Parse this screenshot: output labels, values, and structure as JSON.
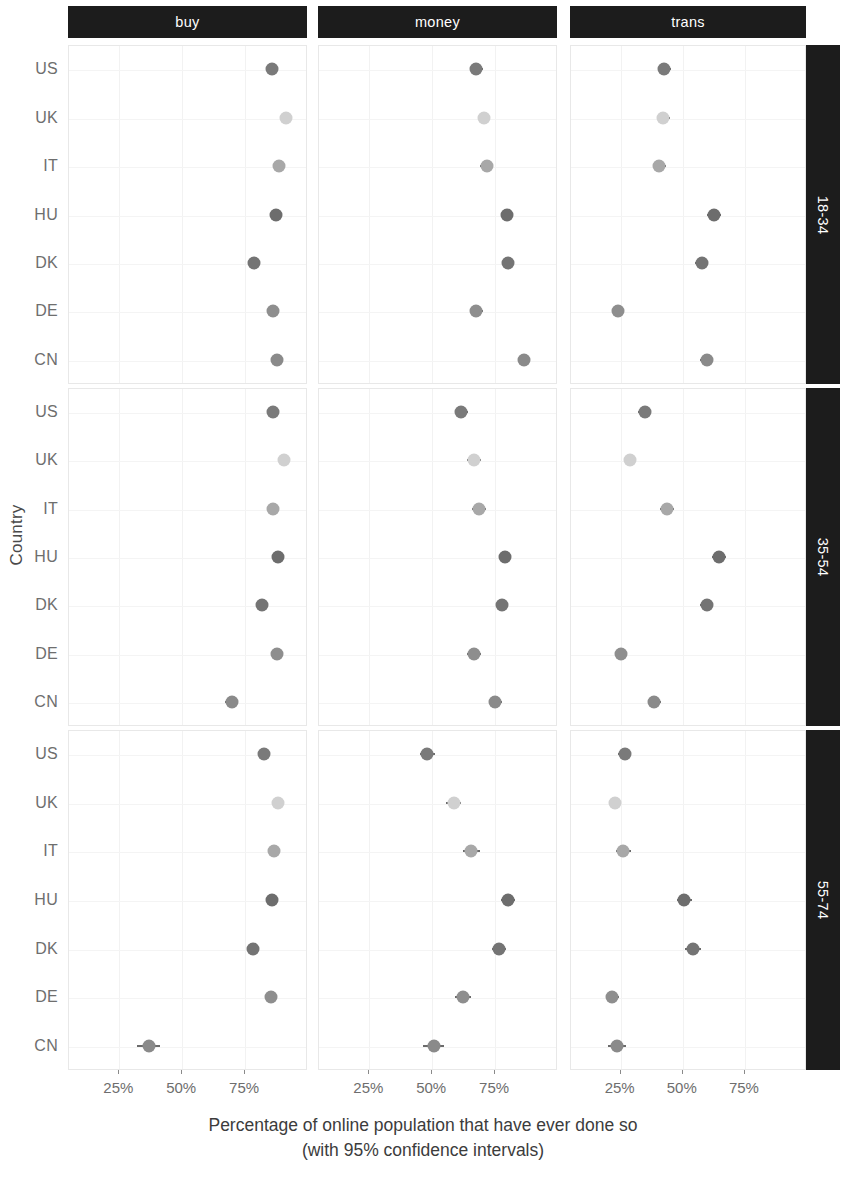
{
  "chart_data": {
    "type": "scatter",
    "title": "",
    "subtitle": "",
    "xlabel_line1": "Percentage of online population that have ever done so",
    "xlabel_line2": "(with 95% confidence intervals)",
    "ylabel": "Country",
    "grid": true,
    "legend": "none",
    "xlim": [
      5,
      100
    ],
    "xticks": [
      25,
      50,
      75
    ],
    "xtick_labels": [
      "25%",
      "50%",
      "75%"
    ],
    "categories": [
      "US",
      "UK",
      "IT",
      "HU",
      "DK",
      "DE",
      "CN"
    ],
    "facet_columns": [
      "buy",
      "money",
      "trans"
    ],
    "facet_rows": [
      "18-34",
      "35-54",
      "55-74"
    ],
    "point_colors": {
      "US": "#7a7a7a",
      "UK": "#d0d0d0",
      "IT": "#a8a8a8",
      "HU": "#6d6d6d",
      "DK": "#747474",
      "DE": "#8e8e8e",
      "CN": "#8a8a8a"
    },
    "series": [
      {
        "facet_col": "buy",
        "facet_row": "18-34",
        "points": [
          {
            "country": "US",
            "value": 86.0,
            "ci_low": 84.2,
            "ci_high": 87.8
          },
          {
            "country": "UK",
            "value": 91.5,
            "ci_low": 89.9,
            "ci_high": 93.1
          },
          {
            "country": "IT",
            "value": 89.0,
            "ci_low": 87.1,
            "ci_high": 90.9
          },
          {
            "country": "HU",
            "value": 87.5,
            "ci_low": 85.6,
            "ci_high": 89.4
          },
          {
            "country": "DK",
            "value": 79.0,
            "ci_low": 77.0,
            "ci_high": 81.0
          },
          {
            "country": "DE",
            "value": 86.5,
            "ci_low": 84.6,
            "ci_high": 88.4
          },
          {
            "country": "CN",
            "value": 88.0,
            "ci_low": 86.2,
            "ci_high": 89.8
          }
        ]
      },
      {
        "facet_col": "buy",
        "facet_row": "35-54",
        "points": [
          {
            "country": "US",
            "value": 86.5,
            "ci_low": 84.8,
            "ci_high": 88.2
          },
          {
            "country": "UK",
            "value": 91.0,
            "ci_low": 89.4,
            "ci_high": 92.6
          },
          {
            "country": "IT",
            "value": 86.5,
            "ci_low": 84.5,
            "ci_high": 88.5
          },
          {
            "country": "HU",
            "value": 88.5,
            "ci_low": 86.6,
            "ci_high": 90.4
          },
          {
            "country": "DK",
            "value": 82.0,
            "ci_low": 80.0,
            "ci_high": 84.0
          },
          {
            "country": "DE",
            "value": 88.0,
            "ci_low": 86.2,
            "ci_high": 89.8
          },
          {
            "country": "CN",
            "value": 70.0,
            "ci_low": 67.5,
            "ci_high": 72.5
          }
        ]
      },
      {
        "facet_col": "buy",
        "facet_row": "55-74",
        "points": [
          {
            "country": "US",
            "value": 83.0,
            "ci_low": 81.0,
            "ci_high": 85.0
          },
          {
            "country": "UK",
            "value": 88.5,
            "ci_low": 86.8,
            "ci_high": 90.2
          },
          {
            "country": "IT",
            "value": 87.0,
            "ci_low": 84.6,
            "ci_high": 89.4
          },
          {
            "country": "HU",
            "value": 86.0,
            "ci_low": 83.6,
            "ci_high": 88.4
          },
          {
            "country": "DK",
            "value": 78.5,
            "ci_low": 76.5,
            "ci_high": 80.5
          },
          {
            "country": "DE",
            "value": 85.5,
            "ci_low": 83.5,
            "ci_high": 87.5
          },
          {
            "country": "CN",
            "value": 37.0,
            "ci_low": 32.5,
            "ci_high": 41.5
          }
        ]
      },
      {
        "facet_col": "money",
        "facet_row": "18-34",
        "points": [
          {
            "country": "US",
            "value": 68.0,
            "ci_low": 65.5,
            "ci_high": 70.5
          },
          {
            "country": "UK",
            "value": 71.0,
            "ci_low": 68.6,
            "ci_high": 73.4
          },
          {
            "country": "IT",
            "value": 72.0,
            "ci_low": 69.4,
            "ci_high": 74.6
          },
          {
            "country": "HU",
            "value": 80.0,
            "ci_low": 77.6,
            "ci_high": 82.4
          },
          {
            "country": "DK",
            "value": 80.5,
            "ci_low": 78.1,
            "ci_high": 82.9
          },
          {
            "country": "DE",
            "value": 68.0,
            "ci_low": 65.4,
            "ci_high": 70.6
          },
          {
            "country": "CN",
            "value": 87.0,
            "ci_low": 84.8,
            "ci_high": 89.2
          }
        ]
      },
      {
        "facet_col": "money",
        "facet_row": "35-54",
        "points": [
          {
            "country": "US",
            "value": 62.0,
            "ci_low": 59.4,
            "ci_high": 64.6
          },
          {
            "country": "UK",
            "value": 67.0,
            "ci_low": 64.4,
            "ci_high": 69.6
          },
          {
            "country": "IT",
            "value": 69.0,
            "ci_low": 66.2,
            "ci_high": 71.8
          },
          {
            "country": "HU",
            "value": 79.5,
            "ci_low": 77.1,
            "ci_high": 81.9
          },
          {
            "country": "DK",
            "value": 78.0,
            "ci_low": 75.6,
            "ci_high": 80.4
          },
          {
            "country": "DE",
            "value": 67.0,
            "ci_low": 64.4,
            "ci_high": 69.6
          },
          {
            "country": "CN",
            "value": 75.5,
            "ci_low": 72.9,
            "ci_high": 78.1
          }
        ]
      },
      {
        "facet_col": "money",
        "facet_row": "55-74",
        "points": [
          {
            "country": "US",
            "value": 48.5,
            "ci_low": 45.6,
            "ci_high": 51.4
          },
          {
            "country": "UK",
            "value": 59.0,
            "ci_low": 56.0,
            "ci_high": 62.0
          },
          {
            "country": "IT",
            "value": 66.0,
            "ci_low": 62.8,
            "ci_high": 69.2
          },
          {
            "country": "HU",
            "value": 80.5,
            "ci_low": 77.6,
            "ci_high": 83.4
          },
          {
            "country": "DK",
            "value": 77.0,
            "ci_low": 74.2,
            "ci_high": 79.8
          },
          {
            "country": "DE",
            "value": 62.5,
            "ci_low": 59.3,
            "ci_high": 65.7
          },
          {
            "country": "CN",
            "value": 51.0,
            "ci_low": 46.8,
            "ci_high": 55.2
          }
        ]
      },
      {
        "facet_col": "trans",
        "facet_row": "18-34",
        "points": [
          {
            "country": "US",
            "value": 43.0,
            "ci_low": 40.4,
            "ci_high": 45.6
          },
          {
            "country": "UK",
            "value": 42.5,
            "ci_low": 39.9,
            "ci_high": 45.1
          },
          {
            "country": "IT",
            "value": 41.0,
            "ci_low": 38.4,
            "ci_high": 43.6
          },
          {
            "country": "HU",
            "value": 63.0,
            "ci_low": 60.3,
            "ci_high": 65.7
          },
          {
            "country": "DK",
            "value": 58.0,
            "ci_low": 55.3,
            "ci_high": 60.7
          },
          {
            "country": "DE",
            "value": 24.5,
            "ci_low": 22.2,
            "ci_high": 26.8
          },
          {
            "country": "CN",
            "value": 60.0,
            "ci_low": 57.4,
            "ci_high": 62.6
          }
        ]
      },
      {
        "facet_col": "trans",
        "facet_row": "35-54",
        "points": [
          {
            "country": "US",
            "value": 35.0,
            "ci_low": 32.5,
            "ci_high": 37.5
          },
          {
            "country": "UK",
            "value": 29.0,
            "ci_low": 26.6,
            "ci_high": 31.4
          },
          {
            "country": "IT",
            "value": 44.0,
            "ci_low": 41.2,
            "ci_high": 46.8
          },
          {
            "country": "HU",
            "value": 65.0,
            "ci_low": 62.3,
            "ci_high": 67.7
          },
          {
            "country": "DK",
            "value": 60.0,
            "ci_low": 57.3,
            "ci_high": 62.7
          },
          {
            "country": "DE",
            "value": 25.5,
            "ci_low": 23.2,
            "ci_high": 27.8
          },
          {
            "country": "CN",
            "value": 39.0,
            "ci_low": 36.2,
            "ci_high": 41.8
          }
        ]
      },
      {
        "facet_col": "trans",
        "facet_row": "55-74",
        "points": [
          {
            "country": "US",
            "value": 27.0,
            "ci_low": 24.4,
            "ci_high": 29.6
          },
          {
            "country": "UK",
            "value": 23.0,
            "ci_low": 20.6,
            "ci_high": 25.4
          },
          {
            "country": "IT",
            "value": 26.5,
            "ci_low": 23.6,
            "ci_high": 29.4
          },
          {
            "country": "HU",
            "value": 51.0,
            "ci_low": 47.9,
            "ci_high": 54.1
          },
          {
            "country": "DK",
            "value": 54.5,
            "ci_low": 51.4,
            "ci_high": 57.6
          },
          {
            "country": "DE",
            "value": 22.0,
            "ci_low": 19.3,
            "ci_high": 24.7
          },
          {
            "country": "CN",
            "value": 24.0,
            "ci_low": 20.4,
            "ci_high": 27.6
          }
        ]
      }
    ]
  }
}
